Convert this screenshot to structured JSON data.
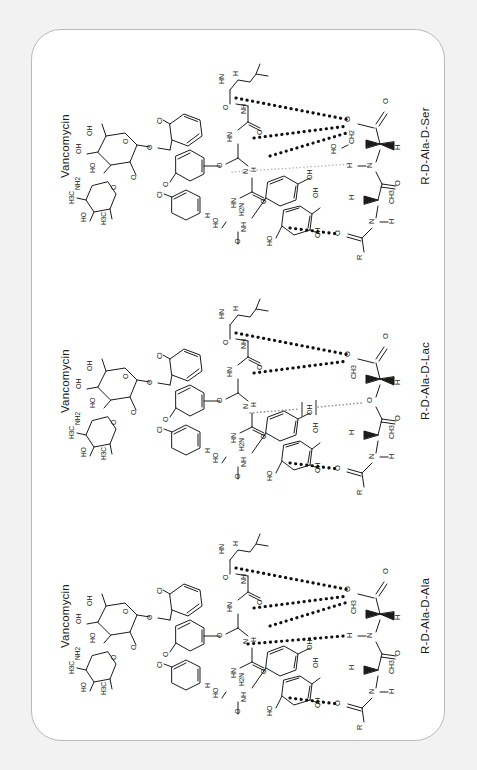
{
  "figure": {
    "background_color": "#f2f2f2",
    "card_color": "#ffffff",
    "card_border_color": "#b9b9b9",
    "ink_color": "#1b1b1b",
    "strong_hbond_color": "#111111",
    "weak_hbond_color": "#b0b0b0",
    "orientation": "rotated-90-ccw",
    "panel_count": 3
  },
  "panels": [
    {
      "id": "panel-ser",
      "left_label": "Vancomycin",
      "right_label": "R-D-Ala-D-Ser",
      "hbond_count": 4,
      "target_residue": "D-Ser",
      "linkage": "amide",
      "sugar_labels": [
        "OH",
        "OH",
        "HO",
        "NH2",
        "H3C",
        "H3C",
        "HO"
      ],
      "aryl_labels": [
        "Cl",
        "Cl",
        "O",
        "O",
        "O",
        "OH",
        "OH",
        "OH",
        "HO"
      ],
      "peptide_labels": [
        "HN",
        "H",
        "O",
        "O",
        "HN",
        "NH",
        "H2N",
        "HO",
        "H"
      ],
      "target_labels": [
        "O",
        "O",
        "CH2",
        "HO",
        "H",
        "N",
        "H",
        "O",
        "CH3",
        "H",
        "N",
        "H",
        "O",
        "R"
      ]
    },
    {
      "id": "panel-lac",
      "left_label": "Vancomycin",
      "right_label": "R-D-Ala-D-Lac",
      "hbond_count": 3,
      "target_residue": "D-Lac",
      "linkage": "ester",
      "sugar_labels": [
        "OH",
        "OH",
        "HO",
        "NH2",
        "H3C",
        "H3C",
        "HO"
      ],
      "aryl_labels": [
        "Cl",
        "Cl",
        "O",
        "O",
        "O",
        "OH",
        "OH",
        "OH",
        "HO"
      ],
      "peptide_labels": [
        "HN",
        "H",
        "O",
        "O",
        "HN",
        "NH",
        "H2N",
        "HO",
        "H"
      ],
      "target_labels": [
        "O",
        "O",
        "CH3",
        "HO",
        "H",
        "O",
        "O",
        "CH3",
        "H",
        "N",
        "H",
        "O",
        "R"
      ],
      "repulsion_markers": 2
    },
    {
      "id": "panel-ala",
      "left_label": "Vancomycin",
      "right_label": "R-D-Ala-D-Ala",
      "hbond_count": 5,
      "target_residue": "D-Ala",
      "linkage": "amide",
      "sugar_labels": [
        "OH",
        "OH",
        "HO",
        "NH2",
        "H3C",
        "H3C",
        "HO"
      ],
      "aryl_labels": [
        "Cl",
        "Cl",
        "O",
        "O",
        "O",
        "OH",
        "OH",
        "OH",
        "HO"
      ],
      "peptide_labels": [
        "HN",
        "H",
        "O",
        "O",
        "HN",
        "NH",
        "H2N",
        "HO",
        "H"
      ],
      "target_labels": [
        "O",
        "O",
        "CH3",
        "H",
        "N",
        "H",
        "O",
        "CH3",
        "H",
        "N",
        "H",
        "O",
        "R"
      ]
    }
  ],
  "atom_text": {
    "OH": "OH",
    "HO": "HO",
    "NH2": "NH2",
    "H2N": "H2N",
    "H3C": "H3C",
    "CH3": "CH3",
    "CH2": "CH2",
    "Cl": "Cl",
    "O": "O",
    "N": "N",
    "H": "H",
    "HN": "HN",
    "NH": "NH",
    "R": "R"
  }
}
